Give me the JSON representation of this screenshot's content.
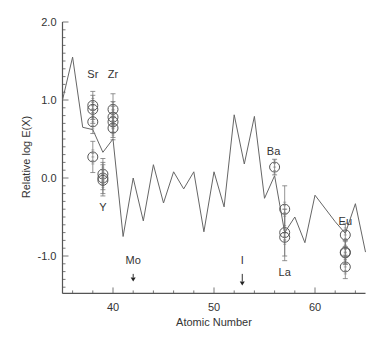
{
  "chart_data": {
    "type": "line",
    "title": "",
    "xlabel": "Atomic Number",
    "ylabel": "Relative log E(X)",
    "xlim": [
      35,
      65
    ],
    "ylim": [
      -1.48,
      2.0
    ],
    "x_ticks": [
      40,
      50,
      60
    ],
    "y_ticks": [
      2.0,
      1.0,
      0.0,
      -1.0
    ],
    "y_tick_labels": [
      "2.0",
      "1.0",
      "0.0",
      "-1.0"
    ],
    "grid": false,
    "legend": null,
    "series": [
      {
        "name": "model curve",
        "style": "line",
        "x": [
          35,
          36,
          37,
          38,
          39,
          40,
          41,
          42,
          43,
          44,
          45,
          46,
          47,
          48,
          49,
          50,
          51,
          52,
          53,
          54,
          55,
          56,
          57,
          58,
          59,
          60,
          62,
          63,
          64,
          65
        ],
        "values": [
          1.0,
          1.55,
          0.65,
          0.62,
          0.33,
          0.5,
          -0.75,
          0.0,
          -0.55,
          0.17,
          -0.32,
          0.08,
          -0.14,
          0.08,
          -0.69,
          0.08,
          -0.37,
          0.81,
          0.18,
          0.79,
          -0.26,
          0.03,
          -0.7,
          -0.5,
          -0.83,
          -0.22,
          -0.56,
          -0.71,
          -0.33,
          -0.95
        ]
      },
      {
        "name": "observations",
        "style": "open-circle-errorbar",
        "points": [
          {
            "element": "Sr",
            "x": 38,
            "y": 0.93,
            "err": 0.18
          },
          {
            "element": "Sr",
            "x": 38,
            "y": 0.88,
            "err": 0.18
          },
          {
            "element": "Sr",
            "x": 38,
            "y": 0.72,
            "err": 0.15
          },
          {
            "element": "Sr",
            "x": 38,
            "y": 0.27,
            "err": 0.2
          },
          {
            "element": "Y",
            "x": 39,
            "y": 0.05,
            "err": 0.2
          },
          {
            "element": "Y",
            "x": 39,
            "y": 0.0,
            "err": 0.2
          },
          {
            "element": "Y",
            "x": 39,
            "y": -0.03,
            "err": 0.2
          },
          {
            "element": "Zr",
            "x": 40,
            "y": 0.88,
            "err": 0.2
          },
          {
            "element": "Zr",
            "x": 40,
            "y": 0.78,
            "err": 0.2
          },
          {
            "element": "Zr",
            "x": 40,
            "y": 0.72,
            "err": 0.2
          },
          {
            "element": "Zr",
            "x": 40,
            "y": 0.64,
            "err": 0.15
          },
          {
            "element": "Ba",
            "x": 56,
            "y": 0.14,
            "err": 0.1
          },
          {
            "element": "La",
            "x": 57,
            "y": -0.4,
            "err": 0.3
          },
          {
            "element": "La",
            "x": 57,
            "y": -0.7,
            "err": 0.3
          },
          {
            "element": "La",
            "x": 57,
            "y": -0.76,
            "err": 0.3
          },
          {
            "element": "Eu",
            "x": 63,
            "y": -0.73,
            "err": 0.15
          },
          {
            "element": "Eu",
            "x": 63,
            "y": -0.95,
            "err": 0.15
          },
          {
            "element": "Eu",
            "x": 63,
            "y": -0.96,
            "err": 0.15
          },
          {
            "element": "Eu",
            "x": 63,
            "y": -1.14,
            "err": 0.15
          }
        ]
      }
    ],
    "annotations": [
      {
        "text": "Sr",
        "x": 38,
        "y": 1.33
      },
      {
        "text": "Zr",
        "x": 40,
        "y": 1.33
      },
      {
        "text": "Y",
        "x": 39,
        "y": -0.37
      },
      {
        "text": "Ba",
        "x": 55.9,
        "y": 0.35
      },
      {
        "text": "La",
        "x": 57,
        "y": -1.2
      },
      {
        "text": "Eu",
        "x": 63,
        "y": -0.55
      },
      {
        "text": "Mo",
        "x": 42,
        "y": -1.05,
        "arrow": "down",
        "arrow_x": 42
      },
      {
        "text": "I",
        "x": 52.8,
        "y": -1.05,
        "arrow": "down",
        "arrow_x": 52.8
      }
    ]
  }
}
